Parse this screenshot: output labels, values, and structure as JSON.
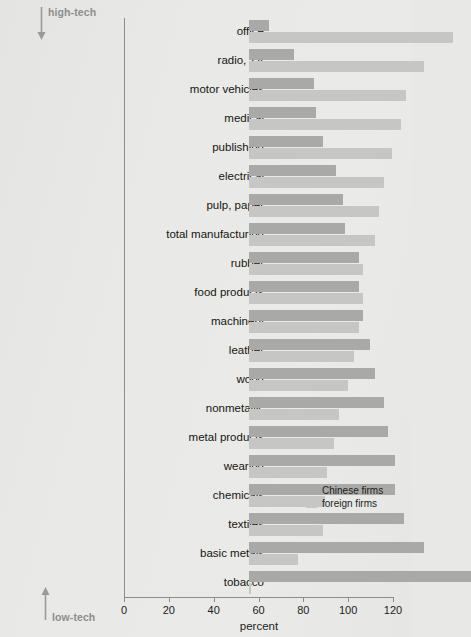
{
  "annotations": {
    "high_tech": "high-tech",
    "low_tech": "low-tech",
    "high_tech_arrow_icon": "arrow-down-icon",
    "low_tech_arrow_icon": "arrow-up-icon",
    "annotation_color": "#8e8e8c"
  },
  "legend": {
    "position": "inside-right",
    "entries": [
      {
        "label": "Chinese firms",
        "color": "#a9a9a7"
      },
      {
        "label": "foreign firms",
        "color": "#c6c6c4"
      }
    ]
  },
  "chart_data": {
    "type": "bar",
    "orientation": "horizontal",
    "title": "",
    "subtitle": "",
    "xlabel": "percent",
    "ylabel": "",
    "xlim": [
      0,
      120
    ],
    "xticks": [
      0,
      20,
      40,
      60,
      80,
      100,
      120
    ],
    "xtick_labels": [
      "0",
      "20",
      "40",
      "60",
      "80",
      "100",
      "120"
    ],
    "grid": false,
    "legend_position": "inside-right",
    "categories": [
      "office",
      "radio, TV",
      "motor vehicles",
      "medical",
      "publishing",
      "electrical",
      "pulp, paper",
      "total manufacturing",
      "rubber",
      "food products",
      "machinery",
      "leather",
      "wood",
      "nonmetallic",
      "metal products",
      "wearing",
      "chemicals",
      "textiles",
      "basic metals",
      "tobacco"
    ],
    "series": [
      {
        "name": "Chinese firms",
        "color": "#a9a9a7",
        "values": [
          9,
          20,
          29,
          30,
          33,
          39,
          42,
          43,
          49,
          49,
          51,
          54,
          56,
          60,
          62,
          65,
          65,
          69,
          78,
          99
        ]
      },
      {
        "name": "foreign firms",
        "color": "#c6c6c4",
        "values": [
          91,
          78,
          70,
          68,
          64,
          60,
          58,
          56,
          51,
          51,
          49,
          47,
          44,
          40,
          38,
          35,
          34,
          33,
          22,
          1
        ]
      }
    ]
  }
}
